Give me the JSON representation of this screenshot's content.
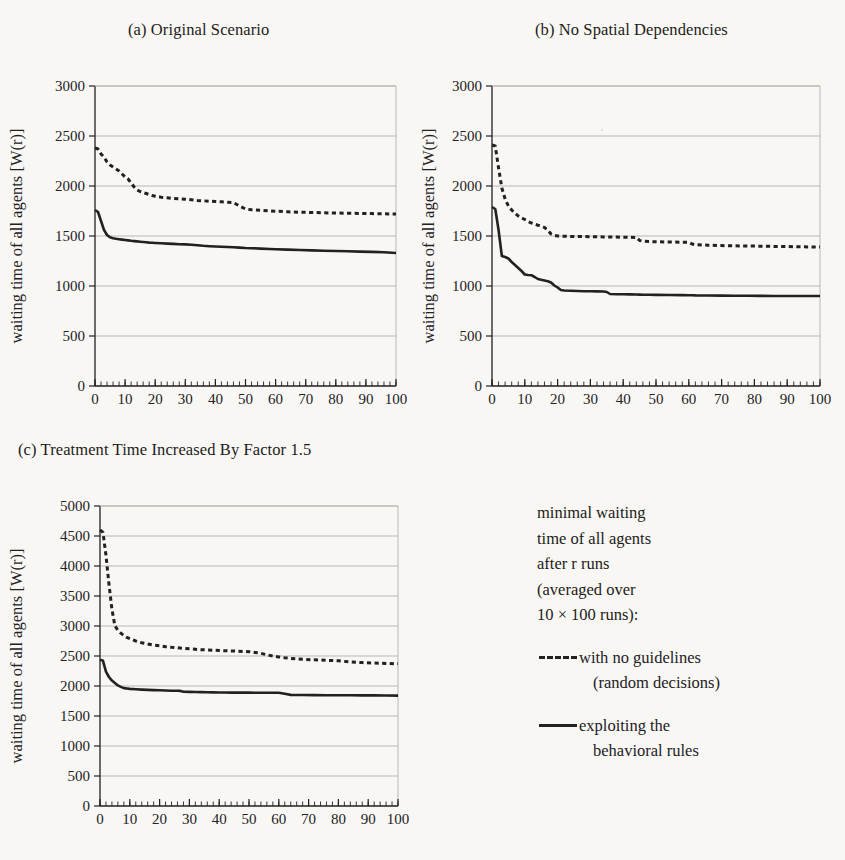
{
  "figure": {
    "background_color": "#f8f7f4",
    "ink_color": "#23211f",
    "grid_color": "#b9b7b2"
  },
  "panels": [
    {
      "id": "a",
      "title": "(a) Original Scenario",
      "xlabel": "runs [r]",
      "ylabel": "waiting time of all agents [W(r)]"
    },
    {
      "id": "b",
      "title": "(b) No Spatial Dependencies",
      "xlabel": "runs [r]",
      "ylabel": "waiting time of all agents [W(r)]"
    },
    {
      "id": "c",
      "title": "(c) Treatment Time Increased By Factor 1.5",
      "xlabel": "runs [r]",
      "ylabel": "waiting time of all agents [W(r)]"
    }
  ],
  "legend": {
    "description_lines": [
      "minimal waiting",
      "time of all agents",
      "after r runs",
      "(averaged over",
      "10 × 100 runs):"
    ],
    "entries": [
      {
        "marker": "dashed",
        "lines": [
          "with no guidelines",
          "(random decisions)"
        ]
      },
      {
        "marker": "solid",
        "lines": [
          "exploiting the",
          "behavioral rules"
        ]
      }
    ]
  },
  "chart_data": [
    {
      "type": "line",
      "id": "a",
      "title": "(a) Original Scenario",
      "xlabel": "runs [r]",
      "ylabel": "waiting time of all agents [W(r)]",
      "xlim": [
        0,
        100
      ],
      "ylim": [
        0,
        3000
      ],
      "xticks": [
        0,
        10,
        20,
        30,
        40,
        50,
        60,
        70,
        80,
        90,
        100
      ],
      "yticks": [
        0,
        500,
        1000,
        1500,
        2000,
        2500,
        3000
      ],
      "xminor_step": 2,
      "grid": "horizontal",
      "legend_position": "external-right",
      "x": [
        0,
        1,
        2,
        3,
        4,
        5,
        6,
        7,
        8,
        9,
        10,
        11,
        12,
        13,
        14,
        15,
        16,
        17,
        18,
        19,
        20,
        22,
        24,
        26,
        28,
        30,
        32,
        34,
        36,
        38,
        40,
        42,
        44,
        46,
        48,
        50,
        52,
        55,
        58,
        60,
        64,
        68,
        72,
        76,
        80,
        84,
        88,
        92,
        96,
        100
      ],
      "series": [
        {
          "name": "with no guidelines (random decisions)",
          "style": "dashed",
          "values": [
            2380,
            2370,
            2320,
            2290,
            2240,
            2210,
            2190,
            2170,
            2150,
            2120,
            2090,
            2070,
            2030,
            1990,
            1960,
            1945,
            1935,
            1925,
            1915,
            1905,
            1898,
            1888,
            1882,
            1876,
            1872,
            1868,
            1862,
            1856,
            1852,
            1848,
            1845,
            1842,
            1838,
            1835,
            1800,
            1770,
            1762,
            1758,
            1752,
            1748,
            1742,
            1738,
            1735,
            1732,
            1730,
            1728,
            1726,
            1724,
            1722,
            1720
          ]
        },
        {
          "name": "exploiting the behavioral rules",
          "style": "solid",
          "values": [
            1760,
            1740,
            1650,
            1560,
            1510,
            1487,
            1478,
            1472,
            1468,
            1464,
            1460,
            1456,
            1452,
            1449,
            1446,
            1443,
            1440,
            1437,
            1434,
            1432,
            1430,
            1427,
            1424,
            1421,
            1418,
            1416,
            1412,
            1408,
            1402,
            1398,
            1395,
            1392,
            1390,
            1388,
            1384,
            1380,
            1378,
            1374,
            1370,
            1368,
            1364,
            1360,
            1356,
            1353,
            1350,
            1347,
            1344,
            1341,
            1337,
            1330
          ]
        }
      ]
    },
    {
      "type": "line",
      "id": "b",
      "title": "(b) No Spatial Dependencies",
      "xlabel": "runs [r]",
      "ylabel": "waiting time of all agents [W(r)]",
      "xlim": [
        0,
        100
      ],
      "ylim": [
        0,
        3000
      ],
      "xticks": [
        0,
        10,
        20,
        30,
        40,
        50,
        60,
        70,
        80,
        90,
        100
      ],
      "yticks": [
        0,
        500,
        1000,
        1500,
        2000,
        2500,
        3000
      ],
      "xminor_step": 2,
      "grid": "horizontal",
      "legend_position": "external-right",
      "x": [
        0,
        1,
        2,
        3,
        4,
        5,
        6,
        7,
        8,
        9,
        10,
        11,
        12,
        13,
        14,
        15,
        16,
        17,
        18,
        19,
        20,
        21,
        22,
        24,
        26,
        28,
        30,
        32,
        34,
        35,
        36,
        38,
        40,
        42,
        44,
        45,
        46,
        48,
        50,
        54,
        58,
        60,
        61,
        62,
        66,
        70,
        74,
        78,
        82,
        86,
        90,
        94,
        100
      ],
      "series": [
        {
          "name": "with no guidelines (random decisions)",
          "style": "dashed",
          "values": [
            2410,
            2400,
            2180,
            1980,
            1870,
            1800,
            1760,
            1730,
            1700,
            1680,
            1665,
            1645,
            1630,
            1618,
            1608,
            1600,
            1585,
            1560,
            1520,
            1505,
            1500,
            1498,
            1497,
            1496,
            1495,
            1494,
            1493,
            1492,
            1491,
            1490,
            1490,
            1489,
            1488,
            1487,
            1486,
            1455,
            1448,
            1444,
            1442,
            1440,
            1438,
            1436,
            1420,
            1412,
            1408,
            1404,
            1402,
            1400,
            1398,
            1396,
            1394,
            1392,
            1390
          ]
        },
        {
          "name": "exploiting the behavioral rules",
          "style": "solid",
          "values": [
            1790,
            1770,
            1560,
            1300,
            1290,
            1275,
            1240,
            1210,
            1180,
            1150,
            1115,
            1110,
            1108,
            1090,
            1070,
            1062,
            1055,
            1048,
            1035,
            1005,
            985,
            960,
            955,
            952,
            950,
            948,
            947,
            946,
            945,
            940,
            920,
            918,
            917,
            916,
            915,
            914,
            913,
            912,
            911,
            910,
            909,
            908,
            907,
            906,
            905,
            904,
            903,
            902,
            901,
            900,
            900,
            900,
            900
          ]
        }
      ]
    },
    {
      "type": "line",
      "id": "c",
      "title": "(c) Treatment Time Increased By Factor 1.5",
      "xlabel": "runs [r]",
      "ylabel": "waiting time of all agents [W(r)]",
      "xlim": [
        0,
        100
      ],
      "ylim": [
        0,
        5000
      ],
      "xticks": [
        0,
        10,
        20,
        30,
        40,
        50,
        60,
        70,
        80,
        90,
        100
      ],
      "yticks": [
        0,
        500,
        1000,
        1500,
        2000,
        2500,
        3000,
        3500,
        4000,
        4500,
        5000
      ],
      "xminor_step": 2,
      "grid": "horizontal",
      "legend_position": "external-right",
      "x": [
        0,
        1,
        2,
        3,
        4,
        5,
        6,
        7,
        8,
        9,
        10,
        12,
        14,
        16,
        18,
        20,
        22,
        24,
        26,
        27,
        28,
        30,
        32,
        34,
        36,
        38,
        40,
        42,
        44,
        46,
        48,
        50,
        52,
        54,
        56,
        58,
        60,
        62,
        64,
        66,
        68,
        72,
        76,
        80,
        84,
        88,
        92,
        96,
        100
      ],
      "series": [
        {
          "name": "with no guidelines (random decisions)",
          "style": "dashed",
          "values": [
            4600,
            4560,
            4180,
            3700,
            3280,
            3000,
            2930,
            2880,
            2840,
            2810,
            2790,
            2750,
            2720,
            2700,
            2680,
            2670,
            2655,
            2645,
            2638,
            2632,
            2628,
            2620,
            2612,
            2605,
            2600,
            2596,
            2592,
            2588,
            2584,
            2580,
            2576,
            2572,
            2560,
            2545,
            2520,
            2500,
            2485,
            2470,
            2460,
            2452,
            2446,
            2436,
            2428,
            2420,
            2400,
            2390,
            2382,
            2376,
            2370
          ]
        },
        {
          "name": "exploiting the behavioral rules",
          "style": "solid",
          "values": [
            2440,
            2420,
            2240,
            2150,
            2090,
            2050,
            2010,
            1985,
            1965,
            1958,
            1952,
            1946,
            1940,
            1936,
            1932,
            1928,
            1925,
            1922,
            1920,
            1918,
            1905,
            1902,
            1900,
            1898,
            1896,
            1894,
            1892,
            1891,
            1890,
            1890,
            1889,
            1889,
            1888,
            1888,
            1888,
            1888,
            1888,
            1870,
            1852,
            1850,
            1849,
            1848,
            1847,
            1846,
            1845,
            1844,
            1843,
            1842,
            1840
          ]
        }
      ]
    }
  ]
}
